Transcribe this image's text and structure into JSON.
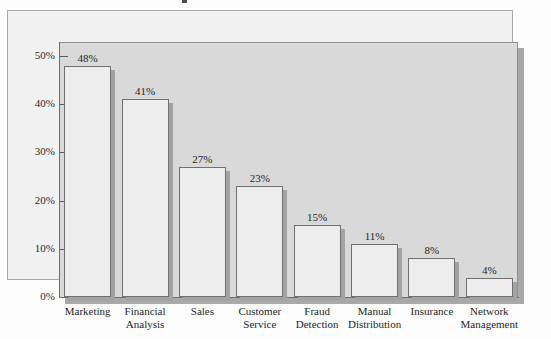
{
  "chart_data": {
    "type": "bar",
    "title": "",
    "xlabel": "",
    "ylabel": "",
    "categories": [
      "Marketing",
      "Financial Analysis",
      "Sales",
      "Customer Service",
      "Fraud Detection",
      "Manual Distribution",
      "Insurance",
      "Network Management"
    ],
    "category_lines": [
      [
        "Marketing"
      ],
      [
        "Financial",
        "Analysis"
      ],
      [
        "Sales"
      ],
      [
        "Customer",
        "Service"
      ],
      [
        "Fraud",
        "Detection"
      ],
      [
        "Manual",
        "Distribution"
      ],
      [
        "Insurance"
      ],
      [
        "Network",
        "Management"
      ]
    ],
    "values": [
      48,
      41,
      27,
      23,
      15,
      11,
      8,
      4
    ],
    "data_labels": [
      "48%",
      "41%",
      "27%",
      "23%",
      "15%",
      "11%",
      "8%",
      "4%"
    ],
    "ylim": [
      0,
      50
    ],
    "ytick_values": [
      0,
      10,
      20,
      30,
      40,
      50
    ],
    "ytick_labels": [
      "0%",
      "10%",
      "20%",
      "30%",
      "40%",
      "50%"
    ],
    "grid": false,
    "legend": "none"
  },
  "colors": {
    "plot_background": "#d9d9d9",
    "frame_background": "#f1f1f1",
    "bar_fill": "#ededed",
    "bar_border": "#707070",
    "axis": "#6e6e6e",
    "shadow": "#a9a9a9",
    "text": "#1f1f1f"
  }
}
